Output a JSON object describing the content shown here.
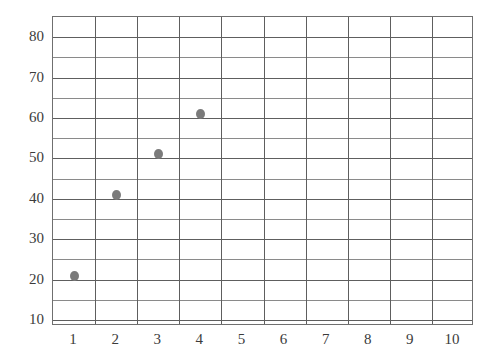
{
  "chart_data": {
    "type": "scatter",
    "title": "",
    "subtitle": "",
    "xlabel": "",
    "ylabel": "",
    "x": [
      1,
      2,
      3,
      4
    ],
    "values": [
      21,
      41,
      51,
      61
    ],
    "points": [
      {
        "x": 1,
        "y": 21
      },
      {
        "x": 2,
        "y": 41
      },
      {
        "x": 3,
        "y": 51
      },
      {
        "x": 4,
        "y": 61
      }
    ],
    "series": [
      {
        "name": "",
        "points": [
          {
            "x": 1,
            "y": 21
          },
          {
            "x": 2,
            "y": 41
          },
          {
            "x": 3,
            "y": 51
          },
          {
            "x": 4,
            "y": 61
          }
        ]
      }
    ],
    "xlim": [
      0.5,
      10.5
    ],
    "ylim": [
      8.5,
      85
    ],
    "x_tick_labels": [
      "1",
      "2",
      "3",
      "4",
      "5",
      "6",
      "7",
      "8",
      "9",
      "10"
    ],
    "x_ticks": [
      1,
      2,
      3,
      4,
      5,
      6,
      7,
      8,
      9,
      10
    ],
    "y_tick_labels": [
      "10",
      "20",
      "30",
      "40",
      "50",
      "60",
      "70",
      "80"
    ],
    "y_ticks": [
      10,
      20,
      30,
      40,
      50,
      60,
      70,
      80
    ],
    "y_gridlines": [
      10,
      15,
      20,
      25,
      30,
      35,
      40,
      45,
      50,
      55,
      60,
      65,
      70,
      75,
      80,
      85
    ],
    "y_gridlines_major": [
      10,
      20,
      30,
      40,
      50,
      60,
      70,
      80
    ],
    "x_gridlines": [
      0.5,
      1.5,
      2.5,
      3.5,
      4.5,
      5.5,
      6.5,
      7.5,
      8.5,
      9.5,
      10.5
    ],
    "grid": true,
    "legend": false,
    "legend_position": "none",
    "marker_color": "#7b7b7b",
    "gridline_color": "#8a8a8a",
    "axis_color": "#6f6f6f",
    "tick_label_color": "#3b3b3b",
    "background_color": "#ffffff"
  }
}
